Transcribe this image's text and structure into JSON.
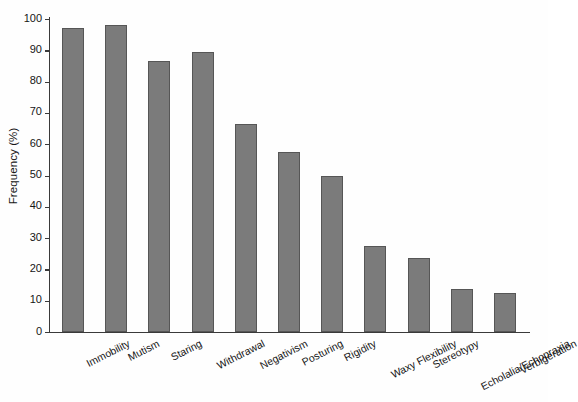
{
  "chart_data": {
    "type": "bar",
    "title": "",
    "xlabel": "",
    "ylabel": "Frequency (%)",
    "ylim": [
      0,
      100
    ],
    "ytick_values": [
      0,
      10,
      20,
      30,
      40,
      50,
      60,
      70,
      80,
      90,
      100
    ],
    "ytick_labels": [
      "0",
      "10",
      "20",
      "30",
      "40",
      "50",
      "60",
      "70",
      "80",
      "90",
      "100"
    ],
    "grid": false,
    "legend": null,
    "bar_color": "#7b7b7b",
    "bar_edge_color": "#565656",
    "axis_color": "#3a3a3a",
    "xtick_label_rotation": -27,
    "categories": [
      "Immobility",
      "Mutism",
      "Staring",
      "Withdrawal",
      "Negativism",
      "Posturing",
      "Rigidity",
      "Waxy Flexibility",
      "Stereotypy",
      "Echolalia/Echopraxia",
      "Verbigeration"
    ],
    "values": [
      97,
      98,
      86.5,
      89.5,
      66.5,
      57.5,
      50,
      27.5,
      23.5,
      13.7,
      12.5
    ]
  }
}
